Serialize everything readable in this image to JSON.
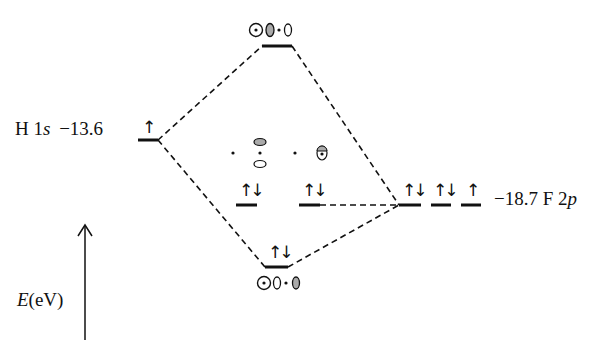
{
  "diagram": {
    "type": "molecular-orbital-diagram",
    "molecule": "HF",
    "left_atom": {
      "element": "H",
      "orbital": "1s",
      "energy_eV": "−13.6",
      "electrons": "↑",
      "label_element": "H 1",
      "label_orbital": "s",
      "label_energy": "−13.6"
    },
    "right_atom": {
      "element": "F",
      "orbital": "2p",
      "energy_eV": "−18.7",
      "label_energy": "−18.7 F 2",
      "label_orbital": "p",
      "levels": [
        {
          "electrons": "↑↓"
        },
        {
          "electrons": "↑↓"
        },
        {
          "electrons": "↑"
        }
      ]
    },
    "molecular_orbitals": [
      {
        "name": "antibonding sigma*",
        "electrons": "",
        "pictogram": "⊙ shaded-lobe · open-lobe"
      },
      {
        "name": "nonbonding pi (1)",
        "electrons": "↑↓",
        "pictogram": "· p-orbital (vertical) ·"
      },
      {
        "name": "nonbonding pi (2)",
        "electrons": "↑↓",
        "pictogram": "· p-orbital (out of plane)"
      },
      {
        "name": "bonding sigma",
        "electrons": "↑↓",
        "pictogram": "⊙ open-lobe · shaded-lobe"
      }
    ],
    "axis": {
      "label_var": "E",
      "label_unit": "(eV)"
    }
  }
}
